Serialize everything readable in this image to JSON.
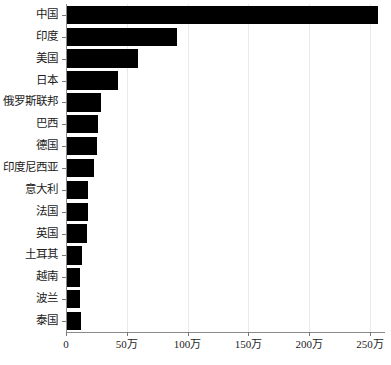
{
  "chart_data": {
    "type": "bar",
    "orientation": "horizontal",
    "title": "",
    "subtitle": "",
    "xlabel": "",
    "ylabel": "",
    "categories": [
      "中国",
      "印度",
      "美国",
      "日本",
      "俄罗斯联邦",
      "巴西",
      "德国",
      "印度尼西亚",
      "意大利",
      "法国",
      "英国",
      "土耳其",
      "越南",
      "波兰",
      "泰国"
    ],
    "values": [
      2565000,
      913000,
      592000,
      428000,
      288000,
      263000,
      255000,
      230000,
      181000,
      181000,
      173000,
      132000,
      115000,
      115000,
      123000
    ],
    "xlim": [
      0,
      2630000
    ],
    "xticks": [
      0,
      500000,
      1000000,
      1500000,
      2000000,
      2500000
    ],
    "xticklabels": [
      "0",
      "50万",
      "100万",
      "150万",
      "200万",
      "250万"
    ],
    "grid": "vertical",
    "legend": null,
    "bar_color": "#000000",
    "grid_color": "#e9e9e9",
    "axis_color": "#8a8a8a",
    "text_color": "#1c1c1c"
  }
}
